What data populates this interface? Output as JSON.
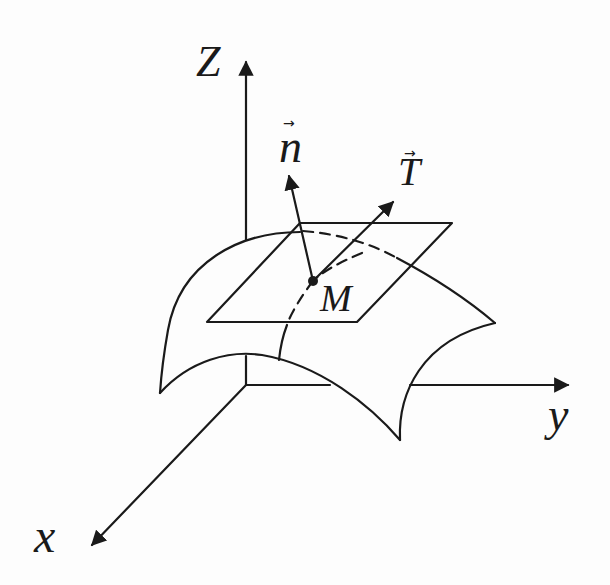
{
  "figure": {
    "colors": {
      "ink": "#1a1a1a",
      "background": "#fdfdfd"
    },
    "axes": {
      "x_label": "x",
      "y_label": "y",
      "z_label": "Z"
    },
    "vectors": {
      "normal_label": "n",
      "normal_arrow": "→",
      "tangent_label": "T",
      "tangent_arrow": "→"
    },
    "point": {
      "label": "M"
    },
    "elements": [
      "coordinate-axes",
      "curved-surface",
      "tangent-plane",
      "normal-vector",
      "tangent-vector",
      "point-M",
      "dashed-hidden-curves"
    ]
  }
}
